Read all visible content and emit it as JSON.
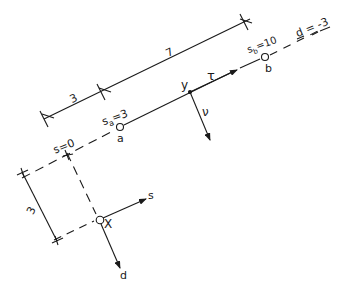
{
  "diagram": {
    "type": "coordinate-geometry-sketch",
    "dimensions": {
      "top_segment_1": "3",
      "top_segment_2": "7",
      "left_offset": "3"
    },
    "labels": {
      "s_zero": "s=0",
      "s_a": "s",
      "s_a_sub": "a",
      "s_a_val": "=3",
      "point_a": "a",
      "s_b": "s",
      "s_b_sub": "b",
      "s_b_val": "=10",
      "point_b": "b",
      "d_value": "d = -3",
      "point_y": "y",
      "tau": "τ",
      "nu": "ν",
      "point_x": "X",
      "axis_s": "s",
      "axis_d": "d"
    },
    "colors": {
      "ink": "#1a1a1a",
      "background": "#ffffff"
    }
  }
}
